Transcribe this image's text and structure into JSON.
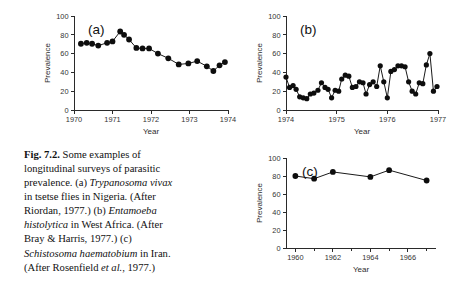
{
  "figure": {
    "caption_label": "Fig. 7.2.",
    "caption_text_1": " Some examples of longitudinal surveys of parasitic prevalence. (a) ",
    "caption_species_a": "Trypanosoma vivax",
    "caption_text_2": " in tsetse flies in Nigeria. (After Riordan, 1977.) (b) ",
    "caption_species_b": "Entamoeba histolytica",
    "caption_text_3": " in West Africa. (After Bray & Harris, 1977.) (c) ",
    "caption_species_c": "Schistosoma haematobium",
    "caption_text_4": " in Iran. (After Rosenfield ",
    "caption_etal": "et al.",
    "caption_text_5": ", 1977.)"
  },
  "chart_data": [
    {
      "id": "a",
      "type": "line",
      "panel_label": "(a)",
      "title": "Trypanosoma vivax in tsetse flies in Nigeria",
      "xlabel": "Year",
      "ylabel": "Prevalence",
      "xlim": [
        1970,
        1974
      ],
      "ylim": [
        0,
        100
      ],
      "yticks": [
        0,
        20,
        40,
        60,
        80,
        100
      ],
      "xticks": [
        1970,
        1971,
        1972,
        1973,
        1974
      ],
      "grid": false,
      "legend": "none",
      "x": [
        1970.18,
        1970.33,
        1970.47,
        1970.63,
        1970.86,
        1971.0,
        1971.2,
        1971.3,
        1971.43,
        1971.62,
        1971.78,
        1971.95,
        1972.18,
        1972.45,
        1972.72,
        1972.97,
        1973.2,
        1973.45,
        1973.62,
        1973.78
      ],
      "y": [
        70.5,
        71.5,
        70.5,
        68.5,
        71.5,
        73.0,
        83.5,
        80.0,
        75.0,
        66.0,
        65.5,
        65.5,
        60.0,
        55.0,
        48.5,
        49.5,
        52.0,
        46.5,
        41.5,
        47.5
      ],
      "x_extra": [
        1973.92
      ],
      "y_extra": [
        51.0
      ]
    },
    {
      "id": "b",
      "type": "line",
      "panel_label": "(b)",
      "title": "Entamoeba histolytica in West Africa",
      "xlabel": "Year",
      "ylabel": "Prevalence",
      "xlim": [
        1974,
        1977
      ],
      "ylim": [
        0,
        100
      ],
      "yticks": [
        0,
        20,
        40,
        60,
        80,
        100
      ],
      "xticks": [
        1974,
        1975,
        1976,
        1977
      ],
      "grid": false,
      "legend": "none",
      "x": [
        1974.0,
        1974.07,
        1974.14,
        1974.2,
        1974.27,
        1974.34,
        1974.41,
        1974.48,
        1974.55,
        1974.63,
        1974.7,
        1974.77,
        1974.83,
        1974.9,
        1974.97,
        1975.04,
        1975.1,
        1975.17,
        1975.24,
        1975.31,
        1975.38,
        1975.45,
        1975.52,
        1975.58,
        1975.65,
        1975.72,
        1975.79,
        1975.86,
        1975.93,
        1976.0,
        1976.07,
        1976.14,
        1976.21,
        1976.28,
        1976.35,
        1976.42,
        1976.49,
        1976.56,
        1976.63,
        1976.7,
        1976.77,
        1976.84,
        1976.91,
        1976.98
      ],
      "y": [
        35.0,
        24.0,
        26.0,
        22.0,
        14.0,
        13.0,
        12.0,
        17.0,
        18.0,
        21.0,
        29.0,
        24.0,
        22.0,
        13.0,
        21.0,
        20.0,
        33.0,
        37.0,
        36.0,
        24.0,
        25.0,
        30.0,
        29.0,
        17.0,
        27.0,
        30.0,
        25.0,
        47.0,
        30.0,
        13.0,
        41.0,
        43.0,
        47.0,
        47.0,
        46.0,
        30.0,
        20.0,
        17.0,
        29.0,
        28.0,
        48.0,
        60.0,
        20.0,
        25.0
      ]
    },
    {
      "id": "c",
      "type": "line",
      "panel_label": "(c)",
      "title": "Schistosoma haematobium in Iran",
      "xlabel": "Year",
      "ylabel": "Prevalence",
      "xlim": [
        1959.5,
        1967.5
      ],
      "ylim": [
        0,
        100
      ],
      "yticks": [
        0,
        20,
        40,
        60,
        80,
        100
      ],
      "xticks": [
        1960,
        1962,
        1964,
        1966
      ],
      "grid": false,
      "legend": "none",
      "x": [
        1960,
        1961,
        1962,
        1964,
        1965,
        1967
      ],
      "y": [
        80.0,
        77.0,
        84.5,
        79.0,
        86.5,
        75.0
      ]
    }
  ]
}
